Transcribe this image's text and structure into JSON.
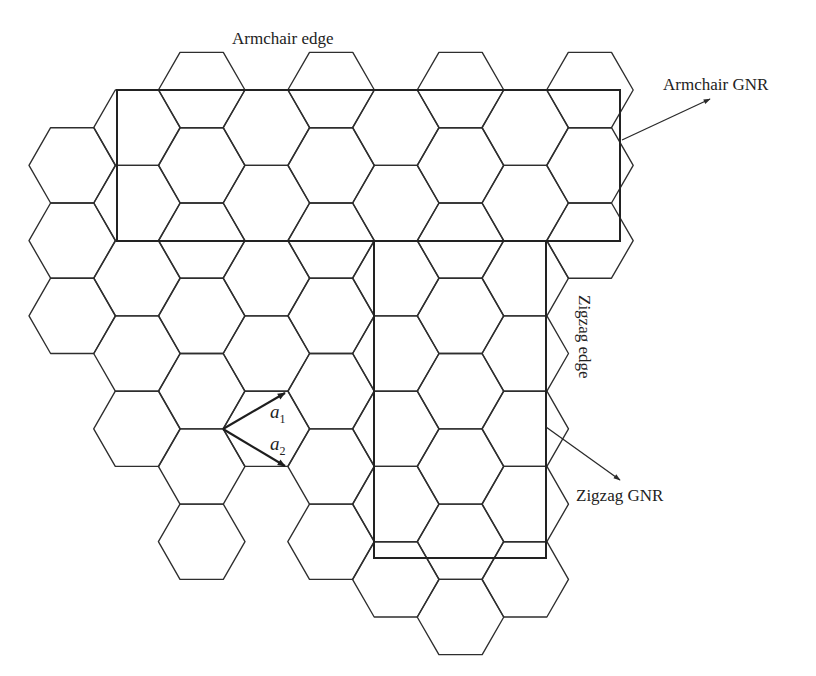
{
  "labels": {
    "armchair_edge": "Armchair edge",
    "armchair_gnr": "Armchair GNR",
    "zigzag_edge": "Zigzag edge",
    "zigzag_gnr": "Zigzag GNR",
    "a1_base": "a",
    "a1_sub": "1",
    "a2_base": "a",
    "a2_sub": "2"
  },
  "lattice": {
    "orientation": "flat-top",
    "edge_length": 43.3,
    "col_x0": 72.3,
    "col_dx": 64.7,
    "row_y0": 52.4,
    "row_dy": 37.64,
    "columns": [
      {
        "col": 0,
        "rows": [
          3,
          5,
          7
        ]
      },
      {
        "col": 1,
        "rows": [
          2,
          4,
          6,
          8,
          10
        ]
      },
      {
        "col": 2,
        "rows": [
          1,
          3,
          5,
          7,
          9,
          11,
          13
        ]
      },
      {
        "col": 3,
        "rows": [
          2,
          4,
          6,
          8,
          10
        ]
      },
      {
        "col": 4,
        "rows": [
          1,
          3,
          5,
          7,
          9,
          11,
          13
        ]
      },
      {
        "col": 5,
        "rows": [
          2,
          4,
          6,
          8,
          10,
          12,
          14
        ]
      },
      {
        "col": 6,
        "rows": [
          1,
          3,
          5,
          7,
          9,
          11,
          13,
          15
        ]
      },
      {
        "col": 7,
        "rows": [
          2,
          4,
          6,
          8,
          10,
          12,
          14
        ]
      },
      {
        "col": 8,
        "rows": [
          1,
          3,
          5
        ]
      }
    ]
  },
  "ribbons": {
    "armchair_gnr": {
      "x": 117,
      "y": 90,
      "width": 503,
      "height": 151
    },
    "zigzag_gnr": {
      "x": 374,
      "y": 241,
      "width": 172,
      "height": 317
    }
  },
  "arrows": {
    "armchair_gnr": {
      "x1": 622,
      "y1": 140,
      "x2": 710,
      "y2": 99
    },
    "zigzag_gnr": {
      "x1": 546,
      "y1": 427,
      "x2": 620,
      "y2": 480
    }
  },
  "vectors": {
    "a1": {
      "x1": 223,
      "y1": 429,
      "x2": 285,
      "y2": 393
    },
    "a2": {
      "x1": 223,
      "y1": 429,
      "x2": 285,
      "y2": 466
    }
  },
  "colors": {
    "line": "#2e2e2e",
    "background": "#ffffff"
  }
}
